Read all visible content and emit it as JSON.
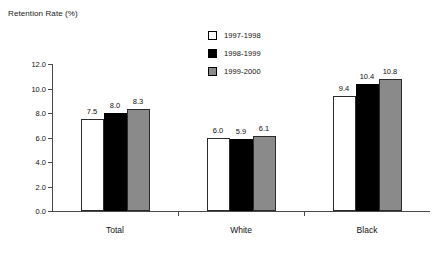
{
  "chart_data": {
    "type": "bar",
    "title": "Retention Rate (%)",
    "xlabel": "",
    "ylabel": "",
    "ylim": [
      0,
      12
    ],
    "ytick_labels": [
      "0.0",
      "2.0",
      "4.0",
      "6.0",
      "8.0",
      "10.0",
      "12.0"
    ],
    "ytick_values": [
      0,
      2,
      4,
      6,
      8,
      10,
      12
    ],
    "grid": false,
    "legend_position": "top-center",
    "categories": [
      "Total",
      "White",
      "Black"
    ],
    "series": [
      {
        "name": "1997-1998",
        "color": "#ffffff",
        "values": [
          7.5,
          6.0,
          9.4
        ],
        "value_labels": [
          "7.5",
          "6.0",
          "9.4"
        ]
      },
      {
        "name": "1998-1999",
        "color": "#000000",
        "values": [
          8.0,
          5.9,
          10.4
        ],
        "value_labels": [
          "8.0",
          "5.9",
          "10.4"
        ]
      },
      {
        "name": "1999-2000",
        "color": "#8a8a8a",
        "values": [
          8.3,
          6.1,
          10.8
        ],
        "value_labels": [
          "8.3",
          "6.1",
          "10.8"
        ]
      }
    ]
  }
}
